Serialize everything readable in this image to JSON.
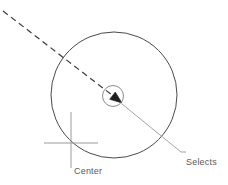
{
  "diagram": {
    "title": "Selects center point",
    "type": "technical-line-drawing",
    "canvas": {
      "width": 228,
      "height": 185,
      "background": "#ffffff"
    },
    "colors": {
      "stroke": "#4a4a4a",
      "light_stroke": "#8c8c8c",
      "text": "#5a5a5a",
      "background": "#ffffff"
    },
    "shapes": {
      "outer_circle": {
        "name": "large-circle",
        "cx": 114,
        "cy": 95,
        "r": 63,
        "stroke": "#4a4a4a",
        "stroke_width": 1,
        "fill": "none"
      },
      "center_snap_circle": {
        "name": "center-snap-marker",
        "cx": 113,
        "cy": 96,
        "r": 10.5,
        "stroke": "#8c8c8c",
        "stroke_width": 1,
        "fill": "none"
      },
      "dashed_pointer_line": {
        "name": "dashed-cursor-line",
        "x1": 3,
        "y1": 11,
        "x2": 121,
        "y2": 102,
        "dash": "6 4",
        "stroke": "#3a3a3a",
        "stroke_width": 1.2
      },
      "arrow_head": {
        "name": "cursor-arrowhead",
        "x": 122,
        "y": 103,
        "angle_deg": 38
      },
      "crosshair_vertical": {
        "name": "crosshair-vertical-line",
        "x1": 71,
        "y1": 112,
        "x2": 71,
        "y2": 168,
        "stroke": "#9a9a9a",
        "stroke_width": 1
      },
      "crosshair_horizontal": {
        "name": "crosshair-horizontal-line",
        "x1": 44,
        "y1": 143,
        "x2": 98,
        "y2": 143,
        "stroke": "#9a9a9a",
        "stroke_width": 1
      },
      "leader_line": {
        "name": "callout-leader-line",
        "points": "122,104 181,152 186,152",
        "stroke": "#9a9a9a",
        "stroke_width": 0.9
      }
    },
    "labels": {
      "center": {
        "text": "Center",
        "x": 74,
        "y": 166
      },
      "callout": {
        "lines": [
          "Selects",
          "center",
          "point"
        ],
        "line1": "Selects",
        "line2": "center",
        "line3": "point",
        "x": 186,
        "y": 137
      }
    }
  }
}
